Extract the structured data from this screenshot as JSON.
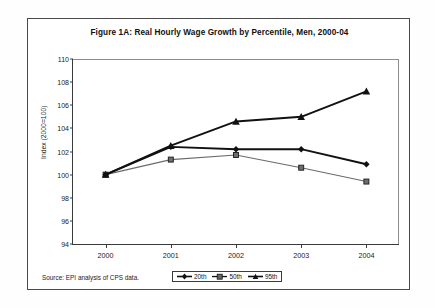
{
  "figure": {
    "title": "Figure 1A: Real Hourly Wage Growth by Percentile, Men, 2000-04",
    "source_note": "Source: EPI analysis of CPS data."
  },
  "axes": {
    "y_title": "Index (2000=100)",
    "y_ticks": [
      "110",
      "108",
      "106",
      "104",
      "102",
      "100",
      "98",
      "96",
      "94"
    ],
    "x_ticks": [
      "2000",
      "2001",
      "2002",
      "2003",
      "2004"
    ]
  },
  "legend": {
    "items": [
      {
        "label": "20th",
        "marker": "diamond-marker",
        "color": "#111111"
      },
      {
        "label": "50th",
        "marker": "square-marker",
        "color": "#555555"
      },
      {
        "label": "95th",
        "marker": "triangle-marker",
        "color": "#111111"
      }
    ]
  },
  "chart_data": {
    "type": "line",
    "title": "Figure 1A: Real Hourly Wage Growth by Percentile, Men, 2000-04",
    "xlabel": "",
    "ylabel": "Index (2000=100)",
    "x": [
      "2000",
      "2001",
      "2002",
      "2003",
      "2004"
    ],
    "ylim": [
      94,
      110
    ],
    "ytick_step": 2,
    "grid": false,
    "legend_position": "bottom-center",
    "series": [
      {
        "name": "20th",
        "marker": "diamond",
        "color": "#111111",
        "values": [
          100.0,
          102.4,
          102.2,
          102.2,
          100.9
        ]
      },
      {
        "name": "50th",
        "marker": "square",
        "color": "#555555",
        "values": [
          100.0,
          101.3,
          101.7,
          100.6,
          99.4
        ]
      },
      {
        "name": "95th",
        "marker": "triangle",
        "color": "#111111",
        "values": [
          100.0,
          102.5,
          104.6,
          105.0,
          107.2
        ]
      }
    ],
    "source": "Source: EPI analysis of CPS data."
  }
}
